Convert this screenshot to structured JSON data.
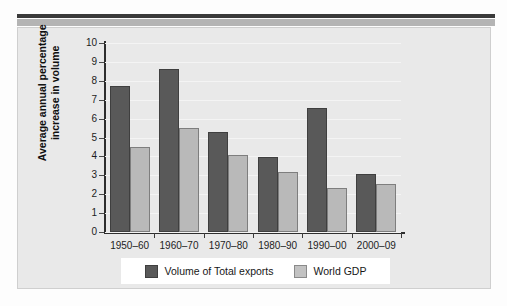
{
  "chart_data": {
    "type": "bar",
    "title": "",
    "xlabel": "",
    "ylabel": "Average annual percentage increase in volume",
    "ylim": [
      0,
      10
    ],
    "ytick_labels": [
      "10",
      "9",
      "8",
      "7",
      "6",
      "5",
      "4",
      "3",
      "2",
      "1",
      "0"
    ],
    "grid": true,
    "legend_position": "bottom",
    "categories": [
      "1950–60",
      "1960–70",
      "1970–80",
      "1980–90",
      "1990–00",
      "2000–09"
    ],
    "series": [
      {
        "name": "Volume of Total exports",
        "color": "#595959",
        "values": [
          7.7,
          8.6,
          5.3,
          3.95,
          6.55,
          3.05
        ]
      },
      {
        "name": "World GDP",
        "color": "#b9b9b9",
        "values": [
          4.5,
          5.5,
          4.1,
          3.2,
          2.35,
          2.55
        ]
      }
    ]
  },
  "axis": {
    "y_title_line1": "Average annual percentage",
    "y_title_line2": "increase in volume"
  },
  "colors": {
    "series_dark": "#595959",
    "series_light": "#b9b9b9",
    "panel_background": "#e9e9e9",
    "axis": "#2e2e2e",
    "top_rule": "#3a3a3a",
    "top_band": "#b4b4b4"
  }
}
